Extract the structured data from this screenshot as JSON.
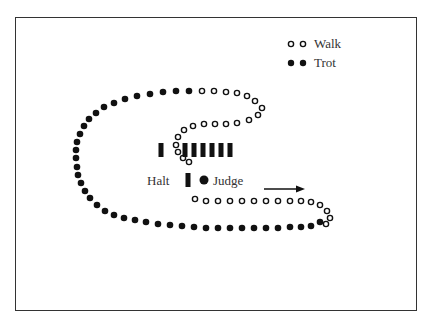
{
  "legend": {
    "items": [
      {
        "label": "Walk",
        "style": "open"
      },
      {
        "label": "Trot",
        "style": "filled"
      }
    ]
  },
  "labels": {
    "halt": "Halt",
    "judge": "Judge"
  },
  "colors": {
    "ink": "#111111",
    "border": "#333333"
  },
  "diagram": {
    "trot_dots": [
      [
        189,
        91
      ],
      [
        176,
        91
      ],
      [
        163,
        92
      ],
      [
        150,
        94
      ],
      [
        137,
        96
      ],
      [
        125,
        99
      ],
      [
        114,
        103
      ],
      [
        104,
        107
      ],
      [
        96,
        113
      ],
      [
        89,
        119
      ],
      [
        84,
        126
      ],
      [
        80,
        134
      ],
      [
        77,
        142
      ],
      [
        76,
        150
      ],
      [
        76,
        158
      ],
      [
        77,
        167
      ],
      [
        78,
        175
      ],
      [
        81,
        183
      ],
      [
        85,
        191
      ],
      [
        90,
        198
      ],
      [
        97,
        205
      ],
      [
        105,
        211
      ],
      [
        114,
        215
      ],
      [
        124,
        218
      ],
      [
        135,
        220
      ],
      [
        146,
        222
      ],
      [
        158,
        224
      ],
      [
        170,
        225
      ],
      [
        182,
        226
      ],
      [
        194,
        227
      ],
      [
        206,
        228
      ],
      [
        218,
        228
      ],
      [
        230,
        228
      ],
      [
        242,
        228
      ],
      [
        254,
        228
      ],
      [
        266,
        228
      ],
      [
        278,
        228
      ],
      [
        290,
        227
      ],
      [
        301,
        227
      ],
      [
        311,
        226
      ],
      [
        320,
        222
      ]
    ],
    "walk_dots": [
      [
        202,
        91
      ],
      [
        214,
        91
      ],
      [
        226,
        92
      ],
      [
        237,
        93
      ],
      [
        247,
        96
      ],
      [
        255,
        101
      ],
      [
        262,
        108
      ],
      [
        258,
        115
      ],
      [
        249,
        120
      ],
      [
        237,
        123
      ],
      [
        226,
        124
      ],
      [
        215,
        124
      ],
      [
        204,
        124
      ],
      [
        193,
        126
      ],
      [
        184,
        130
      ],
      [
        178,
        137
      ],
      [
        176,
        145
      ],
      [
        178,
        152
      ],
      [
        183,
        158
      ],
      [
        189,
        162
      ],
      [
        195,
        199
      ],
      [
        206,
        201
      ],
      [
        218,
        201
      ],
      [
        230,
        201
      ],
      [
        242,
        201
      ],
      [
        254,
        201
      ],
      [
        266,
        201
      ],
      [
        278,
        201
      ],
      [
        290,
        201
      ],
      [
        301,
        201
      ],
      [
        311,
        202
      ],
      [
        320,
        205
      ],
      [
        327,
        211
      ],
      [
        330,
        218
      ],
      [
        326,
        224
      ]
    ],
    "marker_bars": [
      [
        161,
        150
      ],
      [
        185,
        150
      ],
      [
        194,
        150
      ],
      [
        203,
        150
      ],
      [
        212,
        150
      ],
      [
        221,
        150
      ],
      [
        230,
        150
      ]
    ],
    "halt_bar": [
      188,
      180
    ],
    "judge_dot": [
      204,
      180
    ],
    "arrow": {
      "x1": 264,
      "y1": 189,
      "x2": 305,
      "y2": 189
    }
  }
}
